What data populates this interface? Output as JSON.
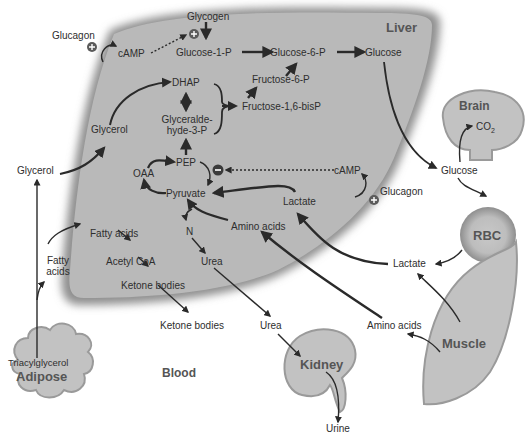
{
  "organs": {
    "liver": "Liver",
    "brain": "Brain",
    "rbc": "RBC",
    "muscle": "Muscle",
    "kidney": "Kidney",
    "adipose": "Adipose",
    "blood": "Blood"
  },
  "liver_labels": {
    "glycogen": "Glycogen",
    "glucose_1_p": "Glucose-1-P",
    "glucose_6_p": "Glucose-6-P",
    "glucose": "Glucose",
    "camp_top": "cAMP",
    "dhap": "DHAP",
    "fructose_6_p": "Fructose-6-P",
    "fructose_16_bisp": "Fructose-1,6-bisP",
    "glyceraldehyde_line1": "Glyceralde-",
    "glyceraldehyde_line2": "hyde-3-P",
    "glycerol": "Glycerol",
    "pep": "PEP",
    "oaa": "OAA",
    "pyruvate": "Pyruvate",
    "camp_mid": "cAMP",
    "lactate": "Lactate",
    "amino_acids": "Amino acids",
    "n": "N",
    "urea": "Urea",
    "fatty_acids": "Fatty acids",
    "acetyl_coa": "Acetyl CoA",
    "ketone_bodies": "Ketone bodies"
  },
  "outside_labels": {
    "glucagon_top": "Glucagon",
    "glucagon_mid": "Glucagon",
    "glycerol": "Glycerol",
    "fatty_acids_line1": "Fatty",
    "fatty_acids_line2": "acids",
    "triacylglycerol": "Triacylglycerol",
    "ketone_bodies": "Ketone bodies",
    "urea": "Urea",
    "urine": "Urine",
    "amino_acids": "Amino acids",
    "lactate": "Lactate",
    "glucose": "Glucose",
    "co2": "CO",
    "co2_sub": "2"
  },
  "symbols": {
    "plus": "+",
    "minus": "−"
  },
  "colors": {
    "liver_fill": "#b9b9b9",
    "organ_fill": "#c2c2c2",
    "outline": "#9a9a9a",
    "arrow": "#2a2a2a",
    "text": "#2e2e2e"
  }
}
